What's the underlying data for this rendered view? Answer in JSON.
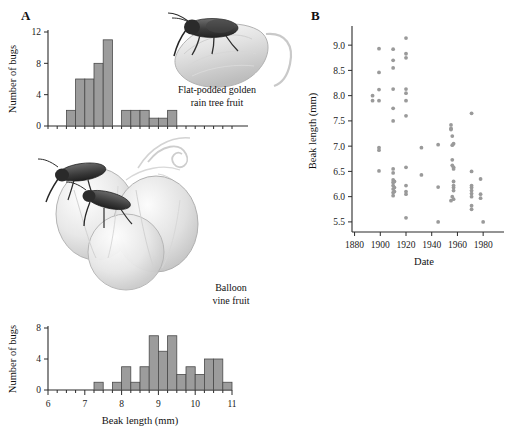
{
  "panels": {
    "a_label": "A",
    "b_label": "B"
  },
  "captions": {
    "top_fruit_line1": "Flat-podded golden",
    "top_fruit_line2": "rain tree fruit",
    "bottom_fruit_line1": "Balloon",
    "bottom_fruit_line2": "vine fruit"
  },
  "colors": {
    "bar_fill": "#9c9c9c",
    "bar_stroke": "#4a4a4a",
    "dot": "#9a9a9a",
    "axis": "#2b2b2b"
  },
  "chart_data": [
    {
      "type": "bar",
      "name": "histogram-golden-rain-tree",
      "title": "",
      "xlabel": "Beak length (mm)",
      "ylabel": "Number of bugs",
      "xlim": [
        6,
        11
      ],
      "ylim": [
        0,
        12
      ],
      "yticks": [
        0,
        4,
        8,
        12
      ],
      "bin_width": 0.25,
      "bin_starts": [
        6.5,
        6.75,
        7.0,
        7.25,
        7.5,
        7.75,
        8.0,
        8.25,
        8.5,
        8.75,
        9.0,
        9.25
      ],
      "categories": [
        "6.50",
        "6.75",
        "7.00",
        "7.25",
        "7.50",
        "7.75",
        "8.00",
        "8.25",
        "8.50",
        "8.75",
        "9.00",
        "9.25"
      ],
      "values": [
        2,
        6,
        6,
        8,
        11,
        0,
        2,
        2,
        2,
        1,
        1,
        2
      ],
      "grid": false,
      "legend": "none"
    },
    {
      "type": "bar",
      "name": "histogram-balloon-vine",
      "title": "",
      "xlabel": "Beak length (mm)",
      "ylabel": "Number of bugs",
      "xlim": [
        6,
        11
      ],
      "ylim": [
        0,
        8
      ],
      "yticks": [
        0,
        4,
        8
      ],
      "xticks": [
        6,
        7,
        8,
        9,
        10,
        11
      ],
      "bin_width": 0.25,
      "bin_starts": [
        7.25,
        7.5,
        7.75,
        8.0,
        8.25,
        8.5,
        8.75,
        9.0,
        9.25,
        9.5,
        9.75,
        10.0,
        10.25,
        10.5,
        10.75
      ],
      "categories": [
        "7.25",
        "7.50",
        "7.75",
        "8.00",
        "8.25",
        "8.50",
        "8.75",
        "9.00",
        "9.25",
        "9.50",
        "9.75",
        "10.00",
        "10.25",
        "10.50",
        "10.75"
      ],
      "values": [
        1,
        0,
        1,
        3,
        1,
        3,
        7,
        5,
        7,
        2,
        3,
        2,
        4,
        4,
        1
      ],
      "grid": false,
      "legend": "none"
    },
    {
      "type": "scatter",
      "name": "scatter-beak-length-vs-date",
      "title": "",
      "xlabel": "Date",
      "ylabel": "Beak length (mm)",
      "xlim": [
        1878,
        1990
      ],
      "ylim": [
        5.3,
        9.3
      ],
      "xticks": [
        1880,
        1900,
        1920,
        1940,
        1960,
        1980
      ],
      "yticks": [
        5.5,
        6.0,
        6.5,
        7.0,
        7.5,
        8.0,
        8.5,
        9.0
      ],
      "grid": false,
      "legend": "none",
      "points": [
        [
          1894,
          7.9
        ],
        [
          1894,
          8.0
        ],
        [
          1899,
          8.93
        ],
        [
          1899,
          8.46
        ],
        [
          1899,
          8.12
        ],
        [
          1899,
          7.9
        ],
        [
          1899,
          6.97
        ],
        [
          1899,
          6.92
        ],
        [
          1899,
          6.51
        ],
        [
          1910,
          8.92
        ],
        [
          1910,
          8.7
        ],
        [
          1910,
          8.55
        ],
        [
          1910,
          8.13
        ],
        [
          1910,
          7.75
        ],
        [
          1910,
          7.5
        ],
        [
          1910,
          6.55
        ],
        [
          1910,
          6.47
        ],
        [
          1910,
          6.33
        ],
        [
          1910,
          6.28
        ],
        [
          1910,
          6.22
        ],
        [
          1910,
          6.15
        ],
        [
          1910,
          6.08
        ],
        [
          1910,
          6.02
        ],
        [
          1911,
          6.3
        ],
        [
          1911,
          6.18
        ],
        [
          1911,
          6.1
        ],
        [
          1920,
          9.14
        ],
        [
          1920,
          8.83
        ],
        [
          1920,
          8.75
        ],
        [
          1920,
          8.13
        ],
        [
          1920,
          8.05
        ],
        [
          1920,
          7.9
        ],
        [
          1920,
          7.6
        ],
        [
          1920,
          6.58
        ],
        [
          1920,
          6.22
        ],
        [
          1920,
          6.1
        ],
        [
          1920,
          6.05
        ],
        [
          1920,
          5.58
        ],
        [
          1932,
          6.97
        ],
        [
          1932,
          6.43
        ],
        [
          1945,
          7.03
        ],
        [
          1945,
          6.19
        ],
        [
          1945,
          5.5
        ],
        [
          1955,
          7.35
        ],
        [
          1955,
          7.33
        ],
        [
          1955,
          7.42
        ],
        [
          1956,
          7.2
        ],
        [
          1956,
          7.02
        ],
        [
          1957,
          7.05
        ],
        [
          1956,
          6.73
        ],
        [
          1956,
          6.62
        ],
        [
          1957,
          6.58
        ],
        [
          1957,
          6.55
        ],
        [
          1957,
          6.3
        ],
        [
          1957,
          6.22
        ],
        [
          1957,
          6.18
        ],
        [
          1957,
          6.12
        ],
        [
          1956,
          6.0
        ],
        [
          1957,
          5.95
        ],
        [
          1955,
          5.92
        ],
        [
          1971,
          7.65
        ],
        [
          1971,
          6.5
        ],
        [
          1978,
          6.35
        ],
        [
          1971,
          6.22
        ],
        [
          1971,
          6.18
        ],
        [
          1971,
          6.12
        ],
        [
          1971,
          6.06
        ],
        [
          1971,
          6.0
        ],
        [
          1978,
          6.05
        ],
        [
          1978,
          5.97
        ],
        [
          1971,
          5.82
        ],
        [
          1971,
          5.75
        ],
        [
          1980,
          5.5
        ]
      ]
    }
  ]
}
